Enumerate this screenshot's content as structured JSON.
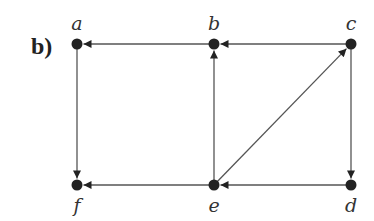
{
  "panel_label": "b)",
  "nodes": [
    {
      "id": "a",
      "label": "a",
      "x": 77,
      "y": 44,
      "label_pos": "above"
    },
    {
      "id": "b",
      "label": "b",
      "x": 214,
      "y": 44,
      "label_pos": "above"
    },
    {
      "id": "c",
      "label": "c",
      "x": 351,
      "y": 44,
      "label_pos": "above"
    },
    {
      "id": "f",
      "label": "f",
      "x": 77,
      "y": 185,
      "label_pos": "below"
    },
    {
      "id": "e",
      "label": "e",
      "x": 214,
      "y": 185,
      "label_pos": "below"
    },
    {
      "id": "d",
      "label": "d",
      "x": 351,
      "y": 185,
      "label_pos": "below"
    }
  ],
  "edges": [
    {
      "from": "b",
      "to": "a"
    },
    {
      "from": "c",
      "to": "b"
    },
    {
      "from": "a",
      "to": "f"
    },
    {
      "from": "e",
      "to": "b"
    },
    {
      "from": "e",
      "to": "c"
    },
    {
      "from": "c",
      "to": "d"
    },
    {
      "from": "e",
      "to": "f"
    },
    {
      "from": "d",
      "to": "e"
    }
  ],
  "colors": {
    "line": "#555555",
    "node": "#222222",
    "text": "#333333"
  }
}
